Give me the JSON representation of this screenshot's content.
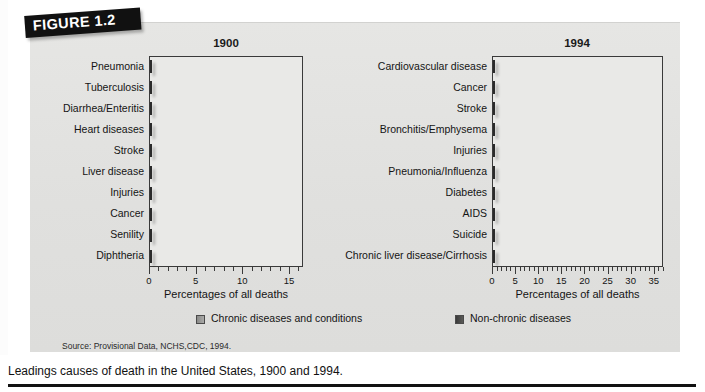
{
  "figure": {
    "banner_label": "FIGURE 1.2",
    "caption": "Leadings causes of death in the United States, 1900 and 1994.",
    "source": "Source: Provisional Data, NCHS,CDC, 1994."
  },
  "legend": {
    "chronic_label": "Chronic diseases and conditions",
    "nonchronic_label": "Non-chronic diseases",
    "chronic_color": "#9a9a98",
    "nonchronic_color": "#444444"
  },
  "axis": {
    "title_left": "Percentages of all deaths",
    "title_right": "Percentages of all deaths"
  },
  "chart_data": [
    {
      "type": "bar",
      "orientation": "horizontal",
      "title": "1900",
      "xlabel": "Percentages of all deaths",
      "ylabel": "",
      "xlim": [
        0,
        16.5
      ],
      "xticks": [
        0,
        5,
        10,
        15
      ],
      "xticklabels": [
        "0",
        "5",
        "10",
        "15"
      ],
      "minor_tick_step": 1,
      "grid": false,
      "legend_position": "below",
      "categories": [
        "Pneumonia",
        "Tuberculosis",
        "Diarrhea/Enteritis",
        "Heart diseases",
        "Stroke",
        "Liver disease",
        "Injuries",
        "Cancer",
        "Senility",
        "Diphtheria"
      ],
      "values": [
        12.5,
        11.8,
        8.8,
        8.5,
        6.2,
        5.2,
        4.5,
        4.3,
        3.7,
        3.0
      ],
      "bar_class": [
        "nonchronic",
        "nonchronic",
        "nonchronic",
        "dark",
        "dark",
        "dark",
        "chronic",
        "dark",
        "chronic",
        "chronic"
      ]
    },
    {
      "type": "bar",
      "orientation": "horizontal",
      "title": "1994",
      "xlabel": "Percentages of all deaths",
      "ylabel": "",
      "xlim": [
        0,
        37
      ],
      "xticks": [
        0,
        5,
        10,
        15,
        20,
        25,
        30,
        35
      ],
      "xticklabels": [
        "0",
        "5",
        "10",
        "15",
        "20",
        "25",
        "30",
        "35"
      ],
      "minor_tick_step": 1,
      "grid": false,
      "legend_position": "below",
      "categories": [
        "Cardiovascular disease",
        "Cancer",
        "Stroke",
        "Bronchitis/Emphysema",
        "Injuries",
        "Pneumonia/Influenza",
        "Diabetes",
        "AIDS",
        "Suicide",
        "Chronic liver disease/Cirrhosis"
      ],
      "values": [
        32.0,
        23.5,
        6.8,
        4.4,
        4.1,
        4.0,
        2.5,
        1.8,
        1.4,
        1.5
      ],
      "bar_class": [
        "dark",
        "dark",
        "dark",
        "dark",
        "chronic",
        "chronic",
        "dark",
        "chronic",
        "chronic",
        "dark"
      ]
    }
  ]
}
